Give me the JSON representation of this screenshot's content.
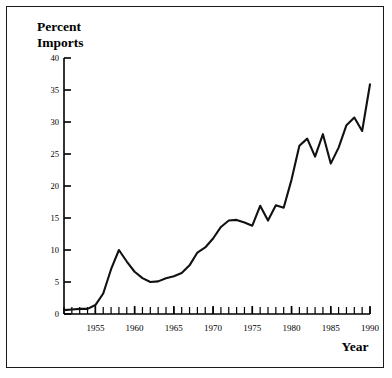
{
  "figure": {
    "background_color": "#ffffff",
    "border_color": "#1a1a1a",
    "line_color": "#111111"
  },
  "labels": {
    "title_line1": "Percent",
    "title_line2": "Imports",
    "xaxis_title": "Year"
  },
  "chart_data": {
    "type": "line",
    "title": "Percent Imports",
    "xlabel": "Year",
    "ylabel": "Percent Imports",
    "xlim": [
      1951,
      1990
    ],
    "ylim": [
      0,
      40
    ],
    "yticks": [
      0,
      5,
      10,
      15,
      20,
      25,
      30,
      35,
      40
    ],
    "ytick_labels": [
      "0",
      "5",
      "10",
      "15",
      "20",
      "25",
      "30",
      "35",
      "40"
    ],
    "xticks": [
      1955,
      1960,
      1965,
      1970,
      1975,
      1980,
      1985,
      1990
    ],
    "xtick_labels": [
      "1955",
      "1960",
      "1965",
      "1970",
      "1975",
      "1980",
      "1985",
      "1990"
    ],
    "minor_xtick_interval": 1,
    "grid": false,
    "legend": null,
    "series": [
      {
        "name": "Percent Imports",
        "x": [
          1951,
          1952,
          1953,
          1954,
          1955,
          1956,
          1957,
          1958,
          1959,
          1960,
          1961,
          1962,
          1963,
          1964,
          1965,
          1966,
          1967,
          1968,
          1969,
          1970,
          1971,
          1972,
          1973,
          1974,
          1975,
          1976,
          1977,
          1978,
          1979,
          1980,
          1981,
          1982,
          1983,
          1984,
          1985,
          1986,
          1987,
          1988,
          1989,
          1990
        ],
        "values": [
          0.6,
          0.7,
          0.8,
          0.8,
          1.4,
          3.2,
          7.0,
          10.0,
          8.2,
          6.6,
          5.6,
          5.0,
          5.1,
          5.6,
          5.9,
          6.4,
          7.6,
          9.6,
          10.4,
          11.8,
          13.6,
          14.6,
          14.7,
          14.3,
          13.8,
          16.9,
          14.6,
          17.0,
          16.6,
          21.0,
          26.3,
          27.4,
          24.6,
          28.1,
          23.5,
          26.0,
          29.5,
          30.7,
          28.6,
          35.9
        ]
      }
    ]
  }
}
